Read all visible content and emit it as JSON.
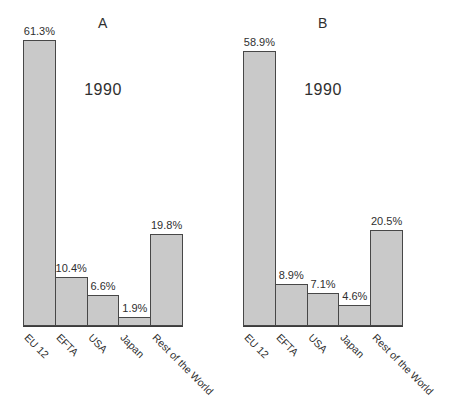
{
  "figure": {
    "background": "#ffffff",
    "text_color": "#2f2f2f"
  },
  "chart_data": [
    {
      "type": "bar",
      "panel_label": "A",
      "title": "1990",
      "categories": [
        "EU 12",
        "EFTA",
        "USA",
        "Japan",
        "Rest of the World"
      ],
      "values": [
        61.3,
        10.4,
        6.6,
        1.9,
        19.8
      ],
      "value_labels": [
        "61.3%",
        "10.4%",
        "6.6%",
        "1.9%",
        "19.8%"
      ],
      "xlabel": "",
      "ylabel": "",
      "ylim": [
        0,
        64
      ],
      "grid": false,
      "legend": "none",
      "tick_rotation_deg": 45,
      "bar_color": "#c9c9c9",
      "bar_border_color": "#474747",
      "axis_color": "#3b3b3b"
    },
    {
      "type": "bar",
      "panel_label": "B",
      "title": "1990",
      "categories": [
        "EU 12",
        "EFTA",
        "USA",
        "Japan",
        "Rest of the World"
      ],
      "values": [
        58.9,
        8.9,
        7.1,
        4.6,
        20.5
      ],
      "value_labels": [
        "58.9%",
        "8.9%",
        "7.1%",
        "4.6%",
        "20.5%"
      ],
      "xlabel": "",
      "ylabel": "",
      "ylim": [
        0,
        64
      ],
      "grid": false,
      "legend": "none",
      "tick_rotation_deg": 45,
      "bar_color": "#c9c9c9",
      "bar_border_color": "#474747",
      "axis_color": "#3b3b3b"
    }
  ]
}
